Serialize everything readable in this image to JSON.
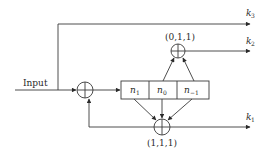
{
  "diagram": {
    "input_label": "Input",
    "register": {
      "cells": [
        {
          "base": "n",
          "sub": "1"
        },
        {
          "base": "n",
          "sub": "0"
        },
        {
          "base": "n",
          "sub": "−1"
        }
      ]
    },
    "xor_gates": {
      "input_adder": {
        "label": ""
      },
      "top": {
        "label": "(0,1,1)"
      },
      "bottom": {
        "label": "(1,1,1)"
      }
    },
    "outputs": [
      {
        "base": "k",
        "sub": "3"
      },
      {
        "base": "k",
        "sub": "2"
      },
      {
        "base": "k",
        "sub": "1"
      }
    ],
    "colors": {
      "stroke": "#3a3a3a",
      "background": "#ffffff"
    }
  }
}
